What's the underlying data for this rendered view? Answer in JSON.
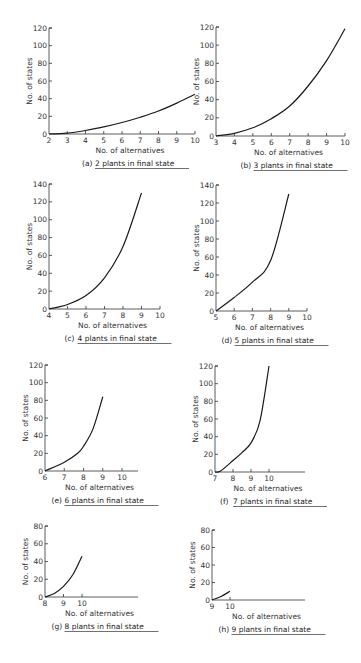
{
  "chart_data": [
    {
      "id": "a",
      "type": "line",
      "caption_letter": "(a)",
      "caption_text": "2 plants in final state",
      "xlabel": "No. of alternatives",
      "ylabel": "No. of states",
      "x_ticks": [
        2,
        3,
        4,
        5,
        6,
        7,
        8,
        9,
        10
      ],
      "y_ticks": [
        0,
        20,
        40,
        60,
        80,
        100,
        120
      ],
      "xlim": [
        2,
        10
      ],
      "ylim": [
        0,
        120
      ],
      "series": [
        {
          "name": "2 plants",
          "x": [
            2,
            3,
            4,
            5,
            6,
            7,
            8,
            9,
            10
          ],
          "y": [
            0,
            1,
            4,
            8,
            13,
            19,
            26,
            35,
            45
          ]
        }
      ],
      "layout": {
        "x0": 49,
        "x1": 195,
        "axis_end": 195,
        "y0": 134,
        "y1": 28
      }
    },
    {
      "id": "b",
      "type": "line",
      "caption_letter": "(b)",
      "caption_text": "3 plants in final state",
      "xlabel": "No. of alternatives",
      "ylabel": "No. of states",
      "x_ticks": [
        3,
        4,
        5,
        6,
        7,
        8,
        9,
        10
      ],
      "y_ticks": [
        0,
        20,
        40,
        60,
        80,
        100,
        120
      ],
      "xlim": [
        3,
        10
      ],
      "ylim": [
        0,
        120
      ],
      "series": [
        {
          "name": "3 plants",
          "x": [
            3,
            4,
            5,
            6,
            7,
            8,
            9,
            10
          ],
          "y": [
            0,
            3,
            9,
            19,
            33,
            55,
            83,
            118
          ]
        }
      ],
      "layout": {
        "x0": 216,
        "x1": 345,
        "axis_end": 345,
        "y0": 136,
        "y1": 27
      }
    },
    {
      "id": "c",
      "type": "line",
      "caption_letter": "(c)",
      "caption_text": "4 plants in final state",
      "xlabel": "No. of alternatives",
      "ylabel": "No. of states",
      "x_ticks": [
        4,
        5,
        6,
        7,
        8,
        9,
        10
      ],
      "y_ticks": [
        0,
        20,
        40,
        60,
        80,
        100,
        120,
        140
      ],
      "xlim": [
        4,
        10
      ],
      "ylim": [
        0,
        140
      ],
      "series": [
        {
          "name": "4 plants",
          "x": [
            4,
            5,
            6,
            7,
            8,
            9
          ],
          "y": [
            0,
            5,
            15,
            35,
            70,
            130
          ]
        }
      ],
      "layout": {
        "x0": 49,
        "x1": 160,
        "axis_end": 160,
        "y0": 309,
        "y1": 184
      }
    },
    {
      "id": "d",
      "type": "line",
      "caption_letter": "(d)",
      "caption_text": "5 plants in final state",
      "xlabel": "No. of alternatives",
      "ylabel": "No. of states",
      "x_ticks": [
        5,
        6,
        7,
        8,
        9,
        10
      ],
      "y_ticks": [
        0,
        20,
        40,
        60,
        80,
        100,
        120,
        140
      ],
      "xlim": [
        5,
        10
      ],
      "ylim": [
        0,
        140
      ],
      "series": [
        {
          "name": "5 plants",
          "x": [
            5,
            6,
            7,
            8,
            9
          ],
          "y": [
            0,
            15,
            32,
            56,
            130
          ]
        }
      ],
      "layout": {
        "x0": 216,
        "x1": 307,
        "axis_end": 307,
        "y0": 311,
        "y1": 185
      }
    },
    {
      "id": "e",
      "type": "line",
      "caption_letter": "(e)",
      "caption_text": "6 plants in final state",
      "xlabel": "No. of alternatives",
      "ylabel": "No. of states",
      "x_ticks": [
        6,
        7,
        8,
        9,
        10
      ],
      "y_ticks": [
        0,
        20,
        40,
        60,
        80,
        100,
        120
      ],
      "xlim": [
        6,
        10
      ],
      "ylim": [
        0,
        120
      ],
      "series": [
        {
          "name": "6 plants",
          "x": [
            6,
            7,
            7.7,
            8,
            8.5,
            9
          ],
          "y": [
            0,
            10,
            20,
            28,
            48,
            84
          ]
        }
      ],
      "layout": {
        "x0": 45,
        "x1": 122,
        "axis_end": 138,
        "y0": 471,
        "y1": 365
      }
    },
    {
      "id": "f",
      "type": "line",
      "caption_letter": "(f)",
      "caption_text": "7 plants in final state",
      "xlabel": "No. of alternatives",
      "ylabel": "No. of states",
      "x_ticks": [
        7,
        8,
        9,
        10
      ],
      "y_ticks": [
        0,
        20,
        40,
        60,
        80,
        100,
        120
      ],
      "xlim": [
        7,
        10
      ],
      "ylim": [
        0,
        120
      ],
      "series": [
        {
          "name": "7 plants",
          "x": [
            7,
            7.3,
            8,
            8.5,
            9,
            9.5,
            10
          ],
          "y": [
            0,
            1,
            13,
            22,
            33,
            58,
            120
          ]
        }
      ],
      "layout": {
        "x0": 215,
        "x1": 269,
        "axis_end": 305,
        "y0": 472,
        "y1": 366
      }
    },
    {
      "id": "g",
      "type": "line",
      "caption_letter": "(g)",
      "caption_text": "8 plants in final state",
      "xlabel": "No. of alternatives",
      "ylabel": "No. of states",
      "x_ticks": [
        8,
        9,
        10
      ],
      "y_ticks": [
        0,
        20,
        40,
        60,
        80
      ],
      "xlim": [
        8,
        10
      ],
      "ylim": [
        0,
        80
      ],
      "series": [
        {
          "name": "8 plants",
          "x": [
            8,
            8.5,
            9,
            9.5,
            10
          ],
          "y": [
            0,
            4,
            12,
            25,
            46
          ]
        }
      ],
      "layout": {
        "x0": 45,
        "x1": 82,
        "axis_end": 138,
        "y0": 597,
        "y1": 526
      }
    },
    {
      "id": "h",
      "type": "line",
      "caption_letter": "(h)",
      "caption_text": "9 plants in final state",
      "xlabel": "No. of alternatives",
      "ylabel": "No. of states",
      "x_ticks": [
        9,
        10
      ],
      "y_ticks": [
        0,
        20,
        40,
        60,
        80
      ],
      "xlim": [
        9,
        10
      ],
      "ylim": [
        0,
        80
      ],
      "series": [
        {
          "name": "9 plants",
          "x": [
            9,
            9.5,
            10
          ],
          "y": [
            0,
            4,
            10
          ]
        }
      ],
      "layout": {
        "x0": 212,
        "x1": 230,
        "axis_end": 305,
        "y0": 600,
        "y1": 530
      }
    }
  ]
}
